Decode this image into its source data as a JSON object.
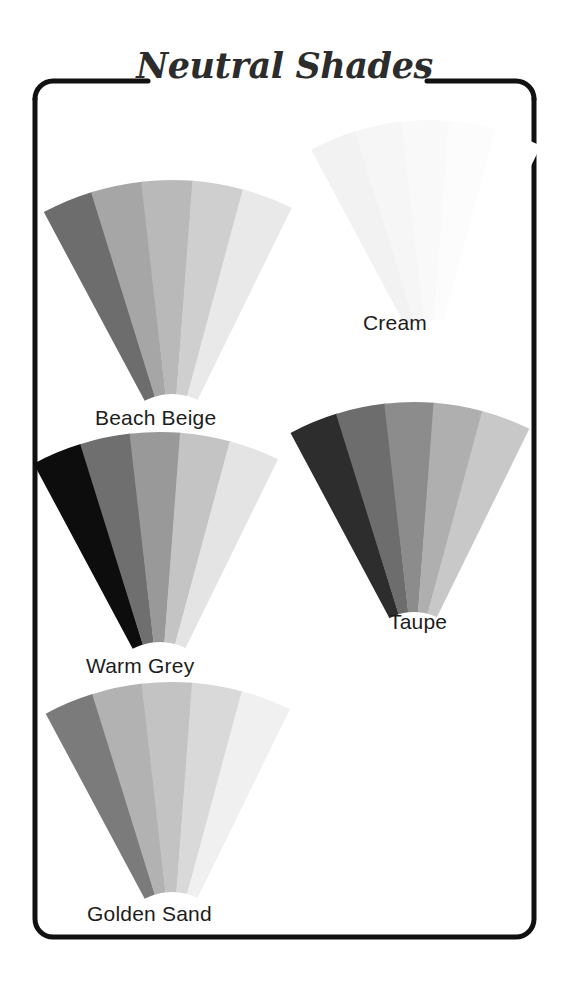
{
  "page": {
    "title": "Neutral Shades",
    "background_color": "#ffffff",
    "frame_color": "#111111",
    "text_color": "#1d1d1d"
  },
  "chart_data": {
    "type": "table",
    "title": "Neutral Shades",
    "legend_position": "below each fan",
    "columns": [
      "shade_name",
      "strip_1",
      "strip_2",
      "strip_3",
      "strip_4",
      "strip_5"
    ],
    "groups": [
      {
        "name": "Beach Beige",
        "label": "Beach Beige",
        "strip_count": 5,
        "swatches": [
          "#6d6d6d",
          "#a6a6a6",
          "#b9b9b9",
          "#cfcfcf",
          "#e9e9e9"
        ],
        "fan": {
          "cx": 172,
          "cy": 452,
          "r_inner": 58,
          "r_outer": 272,
          "start_deg": -118,
          "end_deg": -64
        },
        "label_pos": {
          "x": 95,
          "y": 406
        }
      },
      {
        "name": "Cream",
        "label": "Cream",
        "strip_count": 5,
        "swatches": [
          "#f2f2f2",
          "#f6f6f6",
          "#f9f9f9",
          "#fcfcfc",
          "#ffffff"
        ],
        "fan": {
          "cx": 430,
          "cy": 372,
          "r_inner": 52,
          "r_outer": 252,
          "start_deg": -118,
          "end_deg": -64
        },
        "label_pos": {
          "x": 363,
          "y": 311
        }
      },
      {
        "name": "Warm Grey",
        "label": "Warm Grey",
        "strip_count": 5,
        "swatches": [
          "#0d0d0d",
          "#6f6f6f",
          "#999999",
          "#c4c4c4",
          "#e4e4e4"
        ],
        "fan": {
          "cx": 160,
          "cy": 700,
          "r_inner": 58,
          "r_outer": 268,
          "start_deg": -118,
          "end_deg": -64
        },
        "label_pos": {
          "x": 86,
          "y": 654
        }
      },
      {
        "name": "Taupe",
        "label": "Taupe",
        "strip_count": 5,
        "swatches": [
          "#2d2d2d",
          "#6d6d6d",
          "#8c8c8c",
          "#afafaf",
          "#c8c8c8"
        ],
        "fan": {
          "cx": 414,
          "cy": 664,
          "r_inner": 52,
          "r_outer": 262,
          "start_deg": -118,
          "end_deg": -64
        },
        "label_pos": {
          "x": 389,
          "y": 610
        }
      },
      {
        "name": "Golden Sand",
        "label": "Golden Sand",
        "strip_count": 5,
        "swatches": [
          "#7b7b7b",
          "#b2b2b2",
          "#c3c3c3",
          "#d9d9d9",
          "#f0f0f0"
        ],
        "fan": {
          "cx": 172,
          "cy": 950,
          "r_inner": 58,
          "r_outer": 268,
          "start_deg": -118,
          "end_deg": -64
        },
        "label_pos": {
          "x": 87,
          "y": 902
        }
      }
    ]
  }
}
